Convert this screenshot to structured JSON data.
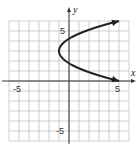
{
  "chart_data": {
    "type": "line",
    "title": "",
    "xlabel": "x",
    "ylabel": "y",
    "xlim": [
      -6,
      6
    ],
    "ylim": [
      -6,
      6
    ],
    "grid": true,
    "x_ticks_labeled": [
      -5,
      5
    ],
    "y_ticks_labeled": [
      5,
      -5
    ],
    "tick_labels": {
      "x_neg": "-5",
      "x_pos": "5",
      "y_pos": "5",
      "y_neg": "-5"
    },
    "series": [
      {
        "name": "parabola x = (2/3)(y-3)^2 - 1",
        "equation": "x = (2/3)(y - 3)^2 - 1",
        "vertex": [
          -1,
          3
        ],
        "opens": "right",
        "arrows_both_ends": true,
        "points": [
          [
            5,
            0
          ],
          [
            3.17,
            0.5
          ],
          [
            1.67,
            1
          ],
          [
            0.5,
            1.5
          ],
          [
            -0.33,
            2
          ],
          [
            -0.83,
            2.5
          ],
          [
            -1,
            3
          ],
          [
            -0.83,
            3.5
          ],
          [
            -0.33,
            4
          ],
          [
            0.5,
            4.5
          ],
          [
            1.67,
            5
          ],
          [
            3.17,
            5.5
          ],
          [
            5,
            6
          ]
        ]
      }
    ]
  }
}
